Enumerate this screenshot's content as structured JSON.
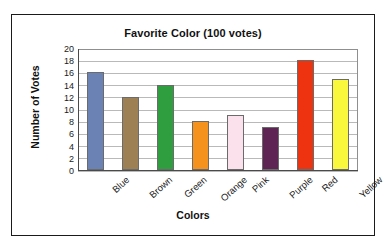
{
  "figure": {
    "background": "#ffffff",
    "frame_color": "#1a1a1a"
  },
  "chart_data": {
    "type": "bar",
    "title": "Favorite Color (100 votes)",
    "xlabel": "Colors",
    "ylabel": "Number of Votes",
    "categories": [
      "Blue",
      "Brown",
      "Green",
      "Orange",
      "Pink",
      "Purple",
      "Red",
      "Yellow"
    ],
    "values": [
      16,
      12,
      14,
      8,
      9,
      7,
      18,
      15
    ],
    "bar_colors": [
      "#6b82b4",
      "#9e8055",
      "#2e9e3e",
      "#f5921e",
      "#fbe1ec",
      "#5e2454",
      "#ee3310",
      "#faf83c"
    ],
    "bar_edge_color": "#6b6b6b",
    "ylim": [
      0,
      20
    ],
    "ytick_values": [
      0,
      2,
      4,
      6,
      8,
      10,
      12,
      14,
      16,
      18,
      20
    ],
    "ytick_labels": [
      "0",
      "2",
      "4",
      "6",
      "8",
      "10",
      "12",
      "14",
      "16",
      "18",
      "20"
    ],
    "grid": "horizontal",
    "grid_color": "#b9b9b9",
    "legend": "none",
    "total_votes": 100
  }
}
